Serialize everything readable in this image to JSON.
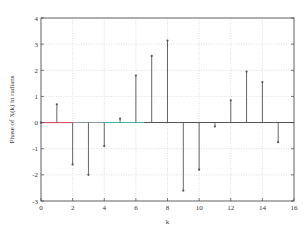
{
  "chart_data": {
    "type": "stem",
    "title": "",
    "xlabel": "k",
    "ylabel": "Phase of X(k) in radians",
    "xlim": [
      0,
      16
    ],
    "ylim": [
      -3,
      4
    ],
    "xticks": [
      0,
      2,
      4,
      6,
      8,
      10,
      12,
      14,
      16
    ],
    "yticks": [
      -3,
      -2,
      -1,
      0,
      1,
      2,
      3,
      4
    ],
    "grid": true,
    "legend": null,
    "x": [
      0,
      1,
      2,
      3,
      4,
      5,
      6,
      7,
      8,
      9,
      10,
      11,
      12,
      13,
      14,
      15
    ],
    "values": [
      0,
      0.7,
      -1.6,
      -2.0,
      -0.9,
      0.15,
      1.8,
      2.55,
      3.14,
      -2.6,
      -1.8,
      -0.15,
      0.85,
      1.95,
      1.55,
      -0.75
    ],
    "baseline_colors": [
      {
        "from": 0,
        "to": 2,
        "color": "#e05060"
      },
      {
        "from": 2,
        "to": 4,
        "color": "#8a9a9a"
      },
      {
        "from": 4,
        "to": 6.5,
        "color": "#3fb8b0"
      },
      {
        "from": 6.5,
        "to": 16,
        "color": "#555555"
      }
    ],
    "stem_color": "#555555",
    "grid_color": "#c8c8c8",
    "axis_color": "#444444"
  }
}
